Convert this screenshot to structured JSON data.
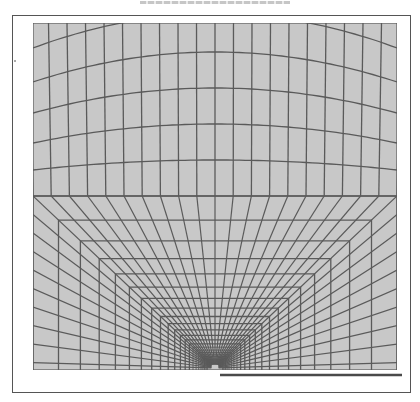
{
  "figure": {
    "caption": "",
    "scale_bar_label": ""
  },
  "colors": {
    "mesh_fill": "#c8c8c8",
    "mesh_line": "#5a5a5a",
    "frame": "#555555",
    "scale_bar": "#4a4a4a",
    "background": "#ffffff"
  },
  "mesh": {
    "upper_region": {
      "columns": 20,
      "arc_rows": 6
    },
    "lower_region": {
      "rings": 22,
      "radial_lines_per_side": 10,
      "radial_lines_bottom": 0
    }
  }
}
